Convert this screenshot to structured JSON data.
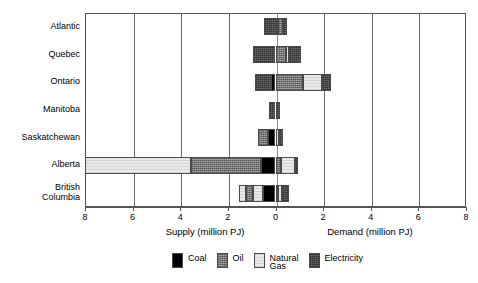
{
  "chart_data": {
    "type": "bar",
    "orientation": "horizontal",
    "title": "",
    "subtitle": "",
    "categories": [
      "Atlantic",
      "Quebec",
      "Ontario",
      "Manitoba",
      "Saskatchewan",
      "Alberta",
      "British\nColumbia"
    ],
    "xlabel_left": "Supply (million PJ)",
    "xlabel_right": "Demand (million PJ)",
    "ylabel": "",
    "xlim": [
      -8,
      8
    ],
    "xticks": [
      -8,
      -6,
      -4,
      -2,
      0,
      2,
      4,
      6,
      8
    ],
    "xtick_labels": [
      "8",
      "6",
      "4",
      "2",
      "0",
      "2",
      "4",
      "6",
      "8"
    ],
    "grid": true,
    "grid_axis": "x",
    "legend_position": "bottom",
    "note": "Negative x values are Supply (left of zero); positive x values are Demand (right of zero). Each row is a diverging stacked bar.",
    "series": [
      {
        "name": "Coal",
        "key": "coal",
        "color": "#000000",
        "pattern": "solid-black"
      },
      {
        "name": "Oil",
        "key": "oil",
        "color": "#a9a9a9",
        "pattern": "fine-cross-hatch"
      },
      {
        "name": "Natural\nGas",
        "key": "gas",
        "color": "#e9e9e9",
        "pattern": "light-dots"
      },
      {
        "name": "Electricity",
        "key": "elec",
        "color": "#6e6e6e",
        "pattern": "dark-cross-hatch"
      }
    ],
    "rows": [
      {
        "category": "Atlantic",
        "supply": [
          {
            "series": "Electricity",
            "start": -0.5,
            "end": 0.0
          }
        ],
        "demand": [
          {
            "series": "Coal",
            "start": 0.0,
            "end": 0.1
          },
          {
            "series": "Oil",
            "start": 0.1,
            "end": 0.32
          },
          {
            "series": "Electricity",
            "start": 0.32,
            "end": 0.5
          }
        ]
      },
      {
        "category": "Quebec",
        "supply": [
          {
            "series": "Electricity",
            "start": -0.95,
            "end": 0.0
          }
        ],
        "demand": [
          {
            "series": "Oil",
            "start": 0.0,
            "end": 0.42
          },
          {
            "series": "Natural Gas",
            "start": 0.42,
            "end": 0.55
          },
          {
            "series": "Electricity",
            "start": 0.55,
            "end": 1.05
          }
        ]
      },
      {
        "category": "Ontario",
        "supply": [
          {
            "series": "Electricity",
            "start": -0.85,
            "end": -0.18
          },
          {
            "series": "Coal",
            "start": -0.18,
            "end": 0.0
          }
        ],
        "demand": [
          {
            "series": "Oil",
            "start": 0.0,
            "end": 1.15
          },
          {
            "series": "Natural Gas",
            "start": 1.15,
            "end": 1.95
          },
          {
            "series": "Electricity",
            "start": 1.95,
            "end": 2.35
          }
        ]
      },
      {
        "category": "Manitoba",
        "supply": [
          {
            "series": "Electricity",
            "start": -0.28,
            "end": 0.0
          }
        ],
        "demand": [
          {
            "series": "Electricity",
            "start": 0.0,
            "end": 0.2
          }
        ]
      },
      {
        "category": "Saskatchewan",
        "supply": [
          {
            "series": "Oil",
            "start": -0.72,
            "end": -0.3
          },
          {
            "series": "Coal",
            "start": -0.3,
            "end": 0.0
          }
        ],
        "demand": [
          {
            "series": "Natural Gas",
            "start": 0.0,
            "end": 0.15
          },
          {
            "series": "Electricity",
            "start": 0.15,
            "end": 0.32
          }
        ]
      },
      {
        "category": "Alberta",
        "supply": [
          {
            "series": "Natural Gas",
            "start": -8.0,
            "end": -3.55
          },
          {
            "series": "Oil",
            "start": -3.55,
            "end": -0.6
          },
          {
            "series": "Coal",
            "start": -0.6,
            "end": 0.0
          }
        ],
        "demand": [
          {
            "series": "Oil",
            "start": 0.0,
            "end": 0.25
          },
          {
            "series": "Natural Gas",
            "start": 0.25,
            "end": 0.8
          },
          {
            "series": "Electricity",
            "start": 0.8,
            "end": 0.95
          }
        ]
      },
      {
        "category": "British Columbia",
        "supply": [
          {
            "series": "Natural Gas",
            "start": -1.52,
            "end": -1.25
          },
          {
            "series": "Oil",
            "start": -1.25,
            "end": -0.95
          },
          {
            "series": "Natural Gas",
            "start": -0.95,
            "end": -0.52
          },
          {
            "series": "Coal",
            "start": -0.52,
            "end": 0.0
          }
        ],
        "demand": [
          {
            "series": "Oil",
            "start": 0.0,
            "end": 0.12
          },
          {
            "series": "Natural Gas",
            "start": 0.12,
            "end": 0.28
          },
          {
            "series": "Electricity",
            "start": 0.28,
            "end": 0.55
          }
        ]
      }
    ]
  },
  "axis": {
    "tick_labels": [
      "8",
      "6",
      "4",
      "2",
      "0",
      "2",
      "4",
      "6",
      "8"
    ],
    "supply_title": "Supply (million PJ)",
    "demand_title": "Demand (million PJ)"
  },
  "categories": [
    {
      "label": "Atlantic"
    },
    {
      "label": "Quebec"
    },
    {
      "label": "Ontario"
    },
    {
      "label": "Manitoba"
    },
    {
      "label": "Saskatchewan"
    },
    {
      "label": "Alberta"
    },
    {
      "label": "British\nColumbia"
    }
  ],
  "legend": {
    "items": [
      {
        "label": "Coal",
        "key": "coal"
      },
      {
        "label": "Oil",
        "key": "oil"
      },
      {
        "label": "Natural\nGas",
        "key": "gas"
      },
      {
        "label": "Electricity",
        "key": "elec"
      }
    ]
  },
  "colors": {
    "coal": "#000000",
    "oil": "#a9a9a9",
    "gas": "#e9e9e9",
    "electricity": "#6e6e6e",
    "frame": "#555555",
    "grid": "#6a6a6a",
    "background": "#ffffff"
  }
}
